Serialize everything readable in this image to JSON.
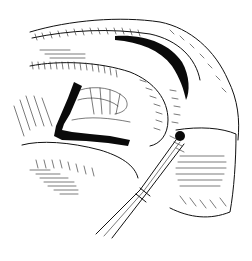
{
  "illustration": {
    "subject": "surgical line drawing",
    "style": "black ink on white",
    "colors": {
      "ink": "#0a0a0a",
      "background": "#ffffff"
    },
    "elements": [
      "tissue-fold",
      "dark-incision-line",
      "retracted-tissue",
      "surgical-instrument"
    ]
  }
}
